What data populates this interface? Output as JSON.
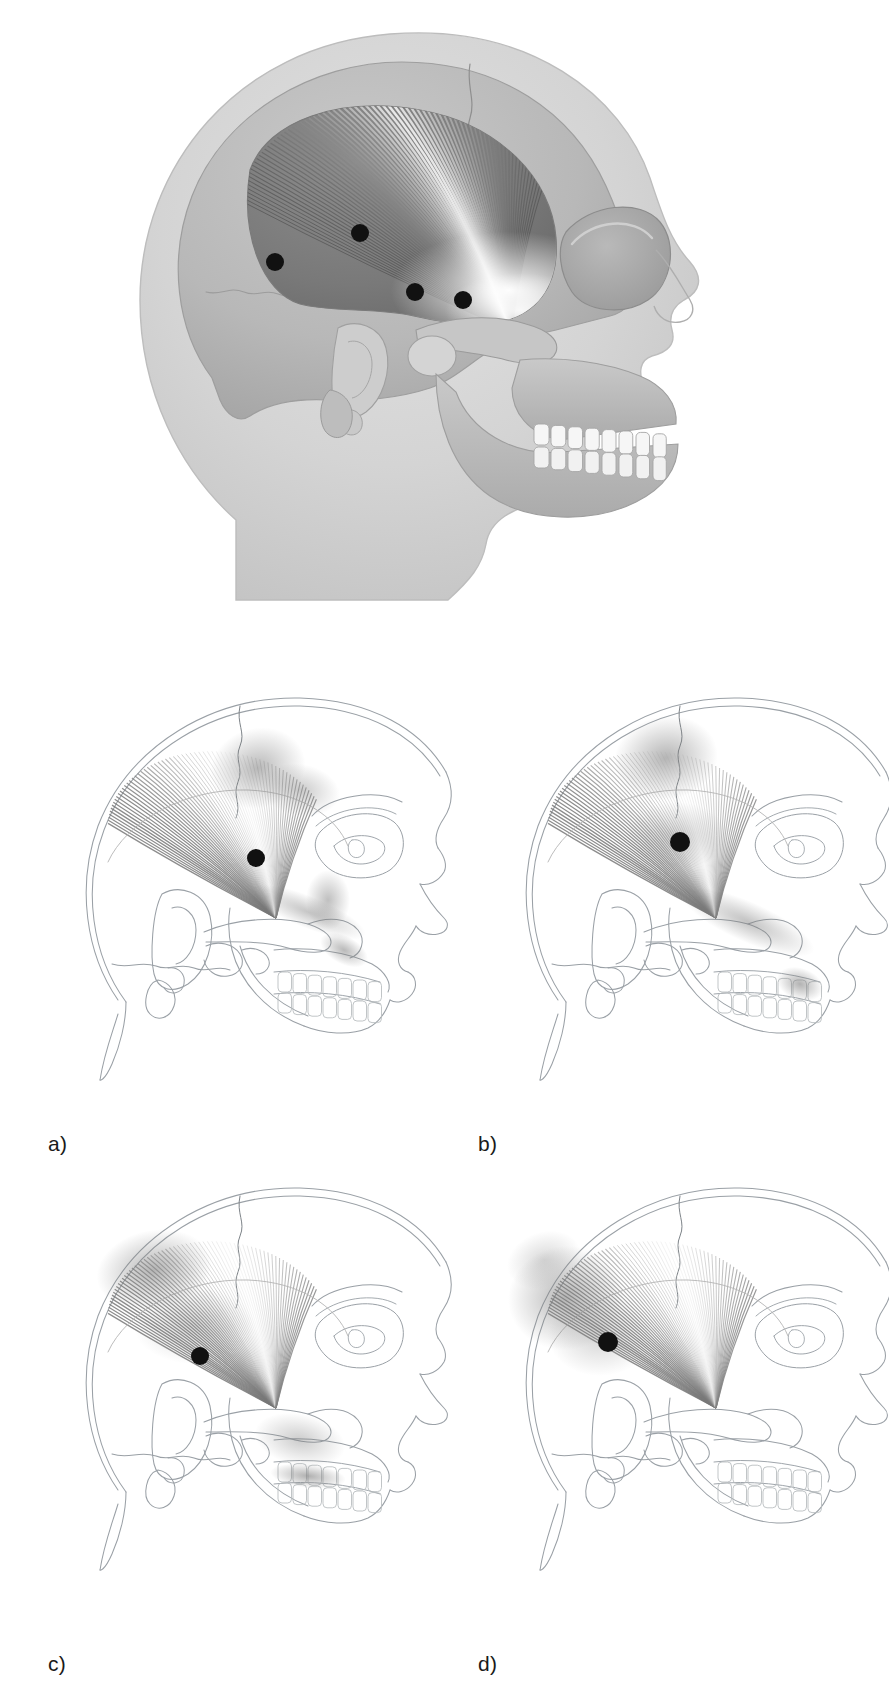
{
  "figure": {
    "title": "Temporalis muscle trigger points and referred pain patterns",
    "background_color": "#ffffff"
  },
  "colors": {
    "skin_light": "#d9d9d9",
    "skin_mid": "#c4c4c4",
    "bone_light": "#cfcfcf",
    "bone_mid": "#b5b5b5",
    "bone_dark": "#9a9a9a",
    "muscle_dark": "#6e6e6e",
    "muscle_mid": "#8f8f8f",
    "muscle_light": "#f2f2f2",
    "tendon_white": "#ffffff",
    "trigger_point": "#111111",
    "outline": "#9aa0a6",
    "outline_dark": "#6b7075",
    "referred_pain": "#808080",
    "teeth": "#f7f7f7",
    "label_text": "#1a1a1a"
  },
  "main_figure": {
    "name": "temporalis-overview",
    "view": "lateral skull with head silhouette",
    "muscle_name": "temporalis",
    "trigger_points": [
      {
        "id": "TrP1",
        "label": "a",
        "x": 463,
        "y": 300,
        "radius": 9
      },
      {
        "id": "TrP2",
        "label": "b",
        "x": 415,
        "y": 292,
        "radius": 9
      },
      {
        "id": "TrP3",
        "label": "c",
        "x": 360,
        "y": 233,
        "radius": 9
      },
      {
        "id": "TrP4",
        "label": "d",
        "x": 275,
        "y": 262,
        "radius": 9
      }
    ]
  },
  "panels": [
    {
      "id": "a",
      "label": "a)",
      "name": "panel-a-trigger-point-1",
      "trigger_point": {
        "x": 248,
        "y": 208,
        "radius": 9
      },
      "referred_pain_regions": [
        "anterior temple above the eyebrow",
        "supraorbital ridge",
        "upper maxillary incisors and canine",
        "along the zygomatic arch to the upper lip"
      ],
      "pain_blobs": [
        {
          "cx": 250,
          "cy": 118,
          "rx": 48,
          "ry": 40,
          "intensity": 0.55,
          "rot": -15
        },
        {
          "cx": 292,
          "cy": 140,
          "rx": 40,
          "ry": 26,
          "intensity": 0.42,
          "rot": 10
        },
        {
          "cx": 320,
          "cy": 250,
          "rx": 22,
          "ry": 30,
          "intensity": 0.5,
          "rot": 0
        },
        {
          "cx": 300,
          "cy": 262,
          "rx": 62,
          "ry": 16,
          "intensity": 0.45,
          "rot": 22
        },
        {
          "cx": 336,
          "cy": 300,
          "rx": 26,
          "ry": 14,
          "intensity": 0.55,
          "rot": 28
        }
      ]
    },
    {
      "id": "b",
      "label": "b)",
      "name": "panel-b-trigger-point-2",
      "trigger_point": {
        "x": 232,
        "y": 192,
        "radius": 10
      },
      "referred_pain_regions": [
        "mid temple region",
        "superior temporal area",
        "upper premolar and molar teeth"
      ],
      "pain_blobs": [
        {
          "cx": 218,
          "cy": 108,
          "rx": 52,
          "ry": 42,
          "intensity": 0.58,
          "rot": -10
        },
        {
          "cx": 228,
          "cy": 186,
          "rx": 52,
          "ry": 34,
          "intensity": 0.35,
          "rot": 0
        },
        {
          "cx": 300,
          "cy": 272,
          "rx": 72,
          "ry": 20,
          "intensity": 0.48,
          "rot": 24
        },
        {
          "cx": 352,
          "cy": 334,
          "rx": 24,
          "ry": 16,
          "intensity": 0.6,
          "rot": 20
        }
      ]
    },
    {
      "id": "c",
      "label": "c)",
      "name": "panel-c-trigger-point-3",
      "trigger_point": {
        "x": 192,
        "y": 216,
        "radius": 9
      },
      "referred_pain_regions": [
        "mid and posterior temple",
        "superior temporal region",
        "upper posterior molar teeth"
      ],
      "pain_blobs": [
        {
          "cx": 146,
          "cy": 130,
          "rx": 58,
          "ry": 40,
          "intensity": 0.58,
          "rot": -12
        },
        {
          "cx": 186,
          "cy": 186,
          "rx": 60,
          "ry": 38,
          "intensity": 0.32,
          "rot": 0
        },
        {
          "cx": 292,
          "cy": 300,
          "rx": 46,
          "ry": 26,
          "intensity": 0.4,
          "rot": 12
        },
        {
          "cx": 300,
          "cy": 336,
          "rx": 38,
          "ry": 12,
          "intensity": 0.62,
          "rot": 6
        }
      ]
    },
    {
      "id": "d",
      "label": "d)",
      "name": "panel-d-trigger-point-4",
      "trigger_point": {
        "x": 160,
        "y": 202,
        "radius": 10
      },
      "referred_pain_regions": [
        "posterior temporal region",
        "parietal region above and behind the ear"
      ],
      "pain_blobs": [
        {
          "cx": 118,
          "cy": 158,
          "rx": 58,
          "ry": 52,
          "intensity": 0.58,
          "rot": -8
        },
        {
          "cx": 152,
          "cy": 196,
          "rx": 52,
          "ry": 40,
          "intensity": 0.34,
          "rot": 0
        },
        {
          "cx": 96,
          "cy": 120,
          "rx": 38,
          "ry": 28,
          "intensity": 0.3,
          "rot": -20
        }
      ]
    }
  ]
}
